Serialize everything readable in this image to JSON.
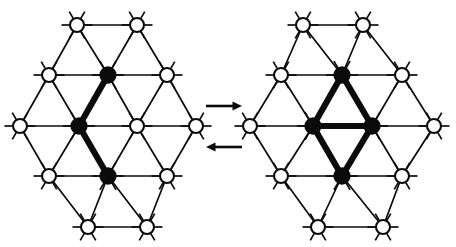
{
  "figure": {
    "type": "lattice-diagram",
    "background_color": "#ffffff",
    "ink_color": "#0b0b0b",
    "panel_count": 2,
    "relation": "reversible",
    "lattice": {
      "type": "triangular",
      "spacing_x": 59,
      "spacing_y": 50,
      "node_open_radius": 7.0,
      "node_filled_radius": 7.6,
      "spoke_length": 8.5,
      "open_node_label": "substrate-site",
      "filled_node_label": "occupied-site"
    },
    "panels": [
      {
        "id": "left",
        "name": "zigzag-trimer",
        "origin_x": 20,
        "origin_y": 126,
        "cluster_size": 3,
        "cluster_shape": "bent-chain",
        "bold_bond_count": 2,
        "rows": [
          {
            "y": 25,
            "xs": [
              77,
              137
            ],
            "filled": []
          },
          {
            "y": 75,
            "xs": [
              49,
              108,
              167
            ],
            "filled": [
              108
            ]
          },
          {
            "y": 126,
            "xs": [
              20,
              79,
              137,
              196
            ],
            "filled": [
              79
            ]
          },
          {
            "y": 176,
            "xs": [
              49,
              108,
              167
            ],
            "filled": [
              108
            ]
          },
          {
            "y": 227,
            "xs": [
              88,
              147
            ],
            "filled": []
          }
        ],
        "cluster_nodes": [
          {
            "x": 108,
            "y": 75
          },
          {
            "x": 79,
            "y": 126
          },
          {
            "x": 108,
            "y": 176
          }
        ],
        "bold_bonds": [
          {
            "x1": 108,
            "y1": 75,
            "x2": 79,
            "y2": 126
          },
          {
            "x1": 79,
            "y1": 126,
            "x2": 108,
            "y2": 176
          }
        ]
      },
      {
        "id": "right",
        "name": "rhombus-tetramer",
        "origin_x": 250,
        "origin_y": 126,
        "cluster_size": 4,
        "cluster_shape": "rhombus",
        "bold_bond_count": 5,
        "rows": [
          {
            "y": 25,
            "xs": [
              303,
              363
            ],
            "filled": []
          },
          {
            "y": 75,
            "xs": [
              281,
              342,
              402
            ],
            "filled": [
              342
            ]
          },
          {
            "y": 126,
            "xs": [
              250,
              313,
              372,
              434
            ],
            "filled": [
              313,
              372
            ]
          },
          {
            "y": 176,
            "xs": [
              281,
              342,
              402
            ],
            "filled": [
              342
            ]
          },
          {
            "y": 227,
            "xs": [
              318,
              383
            ],
            "filled": []
          }
        ],
        "cluster_nodes": [
          {
            "x": 342,
            "y": 75
          },
          {
            "x": 313,
            "y": 126
          },
          {
            "x": 372,
            "y": 126
          },
          {
            "x": 342,
            "y": 176
          }
        ],
        "bold_bonds": [
          {
            "x1": 342,
            "y1": 75,
            "x2": 313,
            "y2": 126
          },
          {
            "x1": 342,
            "y1": 75,
            "x2": 372,
            "y2": 126
          },
          {
            "x1": 313,
            "y1": 126,
            "x2": 372,
            "y2": 126
          },
          {
            "x1": 313,
            "y1": 126,
            "x2": 342,
            "y2": 176
          },
          {
            "x1": 372,
            "y1": 126,
            "x2": 342,
            "y2": 176
          }
        ]
      }
    ],
    "arrows": [
      {
        "id": "forward",
        "name": "forward-arrow",
        "direction": "right",
        "x1": 206,
        "x2": 242,
        "y": 106,
        "label": ""
      },
      {
        "id": "reverse",
        "name": "reverse-arrow",
        "direction": "left",
        "x1": 242,
        "x2": 206,
        "y": 147,
        "label": ""
      }
    ]
  }
}
